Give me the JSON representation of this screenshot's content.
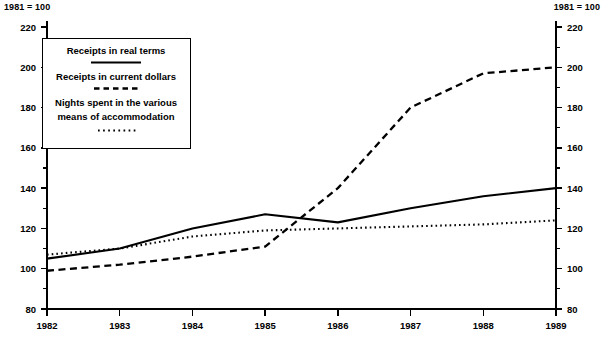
{
  "header": {
    "left_note": "1981 = 100",
    "right_note": "1981 = 100"
  },
  "legend": {
    "items": [
      {
        "label": "Receipts in real terms",
        "style": "solid"
      },
      {
        "label": "Receipts in current dollars",
        "style": "dashed"
      },
      {
        "label_line1": "Nights spent in the various",
        "label_line2": "means of accommodation",
        "style": "dotted"
      }
    ]
  },
  "chart_data": {
    "type": "line",
    "title": "",
    "subtitle": "",
    "xlabel": "",
    "ylabel": "",
    "index_base_note": "1981 = 100",
    "categories": [
      "1982",
      "1983",
      "1984",
      "1985",
      "1986",
      "1987",
      "1988",
      "1989"
    ],
    "x": [
      1982,
      1983,
      1984,
      1985,
      1986,
      1987,
      1988,
      1989
    ],
    "xlim": [
      1982,
      1989
    ],
    "ylim": [
      80,
      220
    ],
    "y_major_ticks": [
      80,
      100,
      120,
      140,
      160,
      180,
      200,
      220
    ],
    "y_minor_ticks": [
      90,
      110,
      130,
      150,
      170,
      190,
      210
    ],
    "y_tick_labels": [
      "80",
      "100",
      "120",
      "140",
      "160",
      "180",
      "200",
      "220"
    ],
    "grid": false,
    "legend_position": "top-left",
    "dual_axis": true,
    "series": [
      {
        "name": "Receipts in real terms",
        "style": "solid",
        "values": [
          105,
          110,
          120,
          127,
          123,
          130,
          136,
          140
        ]
      },
      {
        "name": "Receipts in current dollars",
        "style": "dashed",
        "values": [
          99,
          102,
          106,
          111,
          140,
          180,
          197,
          200
        ]
      },
      {
        "name": "Nights spent in the various means of accommodation",
        "style": "dotted",
        "values": [
          107,
          110,
          116,
          119,
          120,
          121,
          122,
          124
        ]
      }
    ]
  },
  "axes": {
    "left_labels": [
      "220",
      "200",
      "180",
      "160",
      "140",
      "120",
      "100",
      "80"
    ],
    "right_labels": [
      "220",
      "200",
      "180",
      "160",
      "140",
      "120",
      "100",
      "80"
    ],
    "x_labels": [
      "1982",
      "1983",
      "1984",
      "1985",
      "1986",
      "1987",
      "1988",
      "1989"
    ]
  }
}
